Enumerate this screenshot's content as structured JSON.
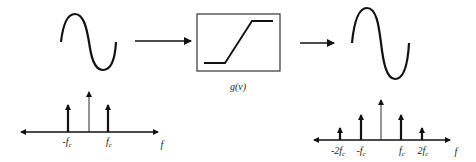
{
  "diagram": {
    "input_signal": {
      "type": "sinusoid",
      "name": "input-sine"
    },
    "arrow_in": {
      "direction": "right"
    },
    "nonlinearity": {
      "label": "g(v)",
      "shape": "saturating-ramp"
    },
    "arrow_out": {
      "direction": "right"
    },
    "output_signal": {
      "type": "sinusoid",
      "name": "output-sine"
    },
    "input_spectrum": {
      "axis_label": "f",
      "impulses": [
        {
          "label_pre": "-f",
          "label_sub": "c",
          "position": "-fc",
          "height": "medium"
        },
        {
          "label_pre": "",
          "label_sub": "",
          "position": "0",
          "height": "tall",
          "thin": true
        },
        {
          "label_pre": "f",
          "label_sub": "c",
          "position": "fc",
          "height": "medium"
        }
      ]
    },
    "output_spectrum": {
      "axis_label": "f",
      "impulses": [
        {
          "label_pre": "-2f",
          "label_sub": "c",
          "position": "-2fc",
          "height": "short"
        },
        {
          "label_pre": "-f",
          "label_sub": "c",
          "position": "-fc",
          "height": "medium"
        },
        {
          "label_pre": "",
          "label_sub": "",
          "position": "0",
          "height": "tall",
          "thin": true
        },
        {
          "label_pre": "f",
          "label_sub": "c",
          "position": "fc",
          "height": "medium"
        },
        {
          "label_pre": "2f",
          "label_sub": "c",
          "position": "2fc",
          "height": "short"
        }
      ]
    }
  },
  "labels": {
    "g": "g(v)",
    "f_left": "f",
    "f_right": "f",
    "l_neg_fc_pre": "-f",
    "l_neg_fc_sub": "c",
    "l_fc_pre": "f",
    "l_fc_sub": "c",
    "r_neg2fc_pre": "-2f",
    "r_neg2fc_sub": "c",
    "r_negfc_pre": "-f",
    "r_negfc_sub": "c",
    "r_fc_pre": "f",
    "r_fc_sub": "c",
    "r_2fc_pre": "2f",
    "r_2fc_sub": "c"
  },
  "colors": {
    "stroke": "#111111",
    "box": "#333333"
  }
}
